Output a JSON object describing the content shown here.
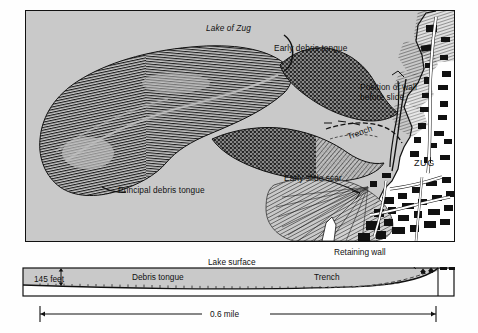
{
  "figure": {
    "kind": "geologic-map-and-cross-section",
    "background_color": "#c9c9c9",
    "ink_color": "#111111",
    "paper_color": "#ffffff"
  },
  "map": {
    "labels": {
      "lake": "Lake of Zug",
      "early_debris_tongue": "Early debris tongue",
      "position_of_wall_line1": "Position of wall",
      "position_of_wall_line2": "before slide",
      "trench": "Trench",
      "town": "ZUG",
      "early_slide_scar": "Early slide scar",
      "principal_debris_tongue": "Principal debris tongue"
    }
  },
  "cross_section": {
    "labels": {
      "depth": "145 feet",
      "depth_value": "145",
      "depth_unit": "feet",
      "lake_surface": "Lake surface",
      "debris_tongue": "Debris tongue",
      "trench": "Trench",
      "retaining_wall": "Retaining wall"
    }
  },
  "scale": {
    "length_label": "0.6 mile"
  }
}
